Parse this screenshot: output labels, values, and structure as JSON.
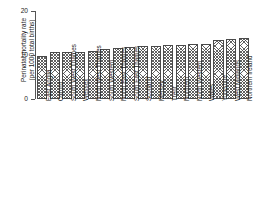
{
  "chart_data": {
    "type": "bar",
    "title": "",
    "xlabel": "",
    "ylabel": "Perinatal mortality rate (per 1000 total births)",
    "ylabel_line1": "Perinatal mortality rate",
    "ylabel_line2": "(per 1000 total births)",
    "ylim": [
      0,
      20
    ],
    "yticks": [
      0,
      10,
      20
    ],
    "ytick_labels": [
      "0",
      "10",
      "20"
    ],
    "grid": false,
    "legend": null,
    "categories": [
      "East Anglia",
      "Oxford",
      "South West Thames",
      "Wessex",
      "North West Thames",
      "South Western",
      "North East Thames",
      "South East Thames",
      "Scotland",
      "Mersey",
      "Trent",
      "Northern",
      "North Western",
      "Wales",
      "Yorkshire",
      "West Midlands",
      "Northern Ireland"
    ],
    "values": [
      9.8,
      10.6,
      10.7,
      10.7,
      10.8,
      11.4,
      11.7,
      11.8,
      12.0,
      12.1,
      12.2,
      12.3,
      12.4,
      12.6,
      13.4,
      13.7,
      13.9
    ]
  },
  "style": {
    "bar_edge_color": "#4a4a4a",
    "bar_fill": "#ffffff",
    "axis_color": "#555555",
    "text_color": "#1a1a1a"
  }
}
